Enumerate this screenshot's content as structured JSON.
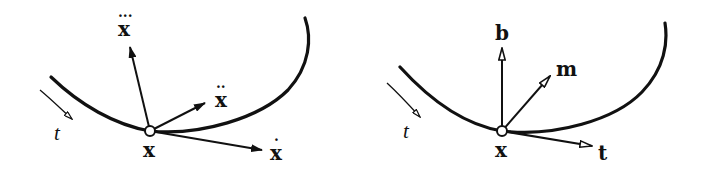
{
  "figure": {
    "colors": {
      "ink": "#111111",
      "background": "#ffffff"
    },
    "left_panel": {
      "point_label": "x",
      "param_label": "t",
      "vectors": [
        {
          "name": "first-derivative",
          "label": "x",
          "dots": "·"
        },
        {
          "name": "second-derivative",
          "label": "x",
          "dots": "··"
        },
        {
          "name": "third-derivative",
          "label": "x",
          "dots": "···"
        }
      ]
    },
    "right_panel": {
      "point_label": "x",
      "param_label": "t",
      "vectors": [
        {
          "name": "tangent",
          "label": "t"
        },
        {
          "name": "main-normal",
          "label": "m"
        },
        {
          "name": "binormal",
          "label": "b"
        }
      ]
    }
  }
}
